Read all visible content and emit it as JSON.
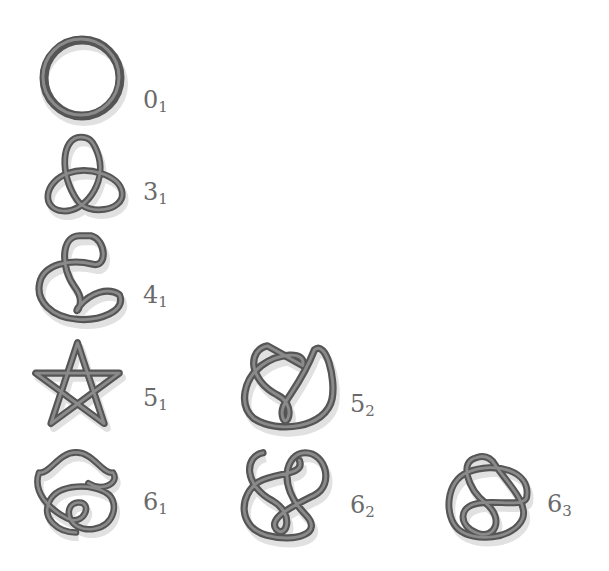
{
  "figure": {
    "knots": [
      {
        "id": "0_1",
        "crossing_number": "0",
        "index": "1",
        "shape": "unknot"
      },
      {
        "id": "3_1",
        "crossing_number": "3",
        "index": "1",
        "shape": "trefoil"
      },
      {
        "id": "4_1",
        "crossing_number": "4",
        "index": "1",
        "shape": "figure-eight"
      },
      {
        "id": "5_1",
        "crossing_number": "5",
        "index": "1",
        "shape": "cinquefoil"
      },
      {
        "id": "5_2",
        "crossing_number": "5",
        "index": "2",
        "shape": "three-twist"
      },
      {
        "id": "6_1",
        "crossing_number": "6",
        "index": "1",
        "shape": "stevedore"
      },
      {
        "id": "6_2",
        "crossing_number": "6",
        "index": "2",
        "shape": "6_2"
      },
      {
        "id": "6_3",
        "crossing_number": "6",
        "index": "3",
        "shape": "6_3"
      }
    ]
  },
  "colors": {
    "tube": "#555555",
    "highlight": "#8a8a8a",
    "label": "#6a6a6a",
    "background": "#ffffff"
  }
}
